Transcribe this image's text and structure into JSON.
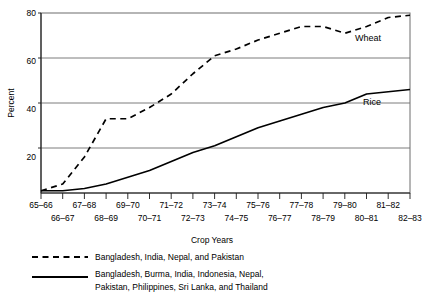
{
  "chart_data": {
    "type": "line",
    "title": "",
    "xlabel": "Crop Years",
    "ylabel": "Percent",
    "ylim": [
      0,
      80
    ],
    "yticks": [
      20,
      40,
      60,
      80
    ],
    "ytick_labels": [
      "20",
      "40",
      "60",
      "80"
    ],
    "grid": true,
    "legend_position": "below-plot",
    "categories": [
      "65–66",
      "66–67",
      "67–68",
      "68–69",
      "69–70",
      "70–71",
      "71–72",
      "72–73",
      "73–74",
      "74–75",
      "75–76",
      "76–77",
      "77–78",
      "78–79",
      "79–80",
      "80–81",
      "81–82",
      "82–83"
    ],
    "series": [
      {
        "name": "Wheat",
        "style": "dashed",
        "legend": "Bangladesh, India, Nepal, and Pakistan",
        "inline_label": "Wheat",
        "values": [
          1,
          4,
          16,
          33,
          33,
          38,
          44,
          53,
          61,
          64,
          68,
          71,
          74,
          74,
          71,
          74,
          78,
          79
        ]
      },
      {
        "name": "Rice",
        "style": "solid",
        "legend": "Bangladesh, Burma, India, Indonesia, Nepal, Pakistan, Philippines, Sri Lanka, and Thailand",
        "inline_label": "Rice",
        "values": [
          1,
          1,
          2,
          4,
          7,
          10,
          14,
          18,
          21,
          25,
          29,
          32,
          35,
          38,
          40,
          44,
          45,
          46
        ]
      }
    ],
    "annotations": [
      {
        "text": "Wheat",
        "x": "81–82",
        "y": 70
      },
      {
        "text": "Rice",
        "x": "81–82",
        "y": 41
      }
    ]
  },
  "legend": {
    "title": "Crop Years",
    "entries": [
      {
        "marker": "dashed-line-icon",
        "label": "Bangladesh, India, Nepal, and Pakistan"
      },
      {
        "marker": "solid-line-icon",
        "label_line1": "Bangladesh, Burma, India, Indonesia, Nepal,",
        "label_line2": "Pakistan, Philippines, Sri Lanka, and Thailand"
      }
    ]
  },
  "axes": {
    "y_title": "Percent",
    "y_tick_0": "80",
    "y_tick_1": "60",
    "y_tick_2": "40",
    "y_tick_3": "20",
    "x_top_row": [
      "65–66",
      "67–68",
      "69–70",
      "71–72",
      "73–74",
      "75–76",
      "77–78",
      "79–80",
      "81–82"
    ],
    "x_bottom_row": [
      "66–67",
      "68–69",
      "70–71",
      "72–73",
      "74–75",
      "76–77",
      "78–79",
      "80–81",
      "82–83"
    ]
  },
  "inline_labels": {
    "wheat": "Wheat",
    "rice": "Rice"
  }
}
